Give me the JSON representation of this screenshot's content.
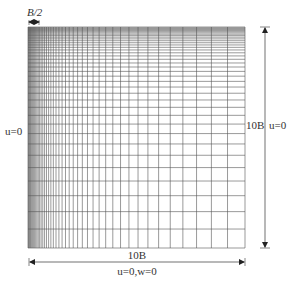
{
  "diagram": {
    "title": "",
    "mesh": {
      "x0": 28,
      "y0": 27,
      "x1": 245,
      "y1": 248,
      "nx": 44,
      "ny": 38,
      "ratio_x": 1.085,
      "ratio_y": 1.09,
      "line_color": "#555555"
    },
    "labels": {
      "top_dim": "B/2",
      "left_bc": "u=0",
      "right_dim": "10B",
      "right_bc": "u=0",
      "bottom_dim": "10B",
      "bottom_bc": "u=0,w=0"
    }
  }
}
